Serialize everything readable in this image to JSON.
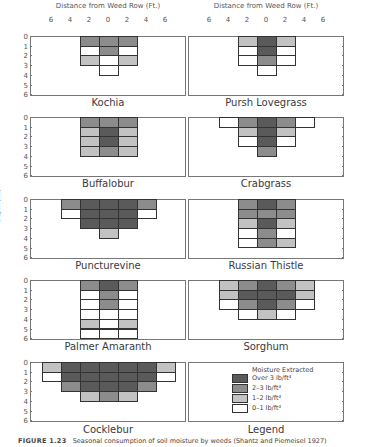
{
  "figure": {
    "x_axis_title": "Distance from Weed Row (Ft.)",
    "x_ticks": [
      "6",
      "4",
      "2",
      "0",
      "2",
      "4",
      "6"
    ],
    "y_axis_title": "Depth (Ft.)",
    "y_ticks": [
      "0",
      "1",
      "2",
      "3",
      "4",
      "5",
      "6"
    ],
    "caption_label": "FIGURE 1.23",
    "caption_text": "Seasonal consumption of soil moisture by weeds (Shantz and Piemeisel 1927)"
  },
  "legend": {
    "title": "Moisture Extracted",
    "label": "Legend",
    "items": [
      {
        "label": "Over 3 lb/ft³",
        "level": 3,
        "color": "#5a5a5a"
      },
      {
        "label": "2–3 lb/ft³",
        "level": 2,
        "color": "#8c8c8c"
      },
      {
        "label": "1–2 lb/ft³",
        "level": 1,
        "color": "#c2c2c2"
      },
      {
        "label": "0–1 lb/ft³",
        "level": 0,
        "color": "#ffffff"
      }
    ]
  },
  "chart_data": {
    "type": "heatmap",
    "title": "Seasonal consumption of soil moisture by weeds",
    "xlabel": "Distance from Weed Row (Ft.)",
    "ylabel": "Depth (Ft.)",
    "x_columns_ft": [
      -6,
      -4,
      -2,
      0,
      2,
      4,
      6
    ],
    "y_rows_ft": [
      0,
      1,
      2,
      3,
      4,
      5
    ],
    "level_scale": {
      "3": "Over 3 lb/ft³",
      "2": "2–3 lb/ft³",
      "1": "1–2 lb/ft³",
      "0": "0–1 lb/ft³",
      "null": "no data"
    },
    "grid": false,
    "legend_position": "bottom-right panel",
    "panels": [
      {
        "name": "Kochia",
        "grid": [
          [
            null,
            null,
            2,
            2,
            2,
            null,
            null
          ],
          [
            null,
            null,
            0,
            2,
            0,
            null,
            null
          ],
          [
            null,
            null,
            1,
            0,
            1,
            null,
            null
          ],
          [
            null,
            null,
            null,
            0,
            null,
            null,
            null
          ]
        ]
      },
      {
        "name": "Pursh Lovegrass",
        "grid": [
          [
            null,
            null,
            1,
            3,
            1,
            null,
            null
          ],
          [
            null,
            null,
            0,
            3,
            0,
            null,
            null
          ],
          [
            null,
            null,
            0,
            2,
            0,
            null,
            null
          ],
          [
            null,
            null,
            null,
            0,
            null,
            null,
            null
          ]
        ]
      },
      {
        "name": "Buffalobur",
        "grid": [
          [
            null,
            null,
            2,
            2,
            2,
            null,
            null
          ],
          [
            null,
            null,
            1,
            3,
            1,
            null,
            null
          ],
          [
            null,
            null,
            1,
            3,
            1,
            null,
            null
          ],
          [
            null,
            null,
            1,
            2,
            1,
            null,
            null
          ]
        ]
      },
      {
        "name": "Crabgrass",
        "grid": [
          [
            null,
            0,
            2,
            3,
            2,
            0,
            null
          ],
          [
            null,
            null,
            1,
            3,
            1,
            null,
            null
          ],
          [
            null,
            null,
            0,
            3,
            0,
            null,
            null
          ],
          [
            null,
            null,
            null,
            2,
            null,
            null,
            null
          ]
        ]
      },
      {
        "name": "Puncturevine",
        "grid": [
          [
            null,
            2,
            3,
            3,
            3,
            2,
            null
          ],
          [
            null,
            0,
            3,
            3,
            3,
            0,
            null
          ],
          [
            null,
            null,
            3,
            3,
            3,
            null,
            null
          ],
          [
            null,
            null,
            null,
            1,
            null,
            null,
            null
          ]
        ]
      },
      {
        "name": "Russian Thistle",
        "grid": [
          [
            null,
            null,
            2,
            3,
            2,
            null,
            null
          ],
          [
            null,
            null,
            2,
            2,
            2,
            null,
            null
          ],
          [
            null,
            null,
            1,
            3,
            1,
            null,
            null
          ],
          [
            null,
            null,
            0,
            2,
            0,
            null,
            null
          ],
          [
            null,
            null,
            0,
            2,
            1,
            null,
            null
          ]
        ]
      },
      {
        "name": "Palmer Amaranth",
        "grid": [
          [
            null,
            null,
            2,
            3,
            2,
            null,
            null
          ],
          [
            null,
            null,
            0,
            2,
            0,
            null,
            null
          ],
          [
            null,
            null,
            0,
            2,
            0,
            null,
            null
          ],
          [
            null,
            null,
            0,
            0,
            0,
            null,
            null
          ],
          [
            null,
            null,
            1,
            0,
            1,
            null,
            null
          ],
          [
            null,
            null,
            0,
            0,
            0,
            null,
            null
          ]
        ]
      },
      {
        "name": "Sorghum",
        "grid": [
          [
            null,
            1,
            2,
            3,
            2,
            1,
            null
          ],
          [
            null,
            1,
            3,
            3,
            3,
            1,
            null
          ],
          [
            null,
            0,
            2,
            3,
            2,
            0,
            null
          ],
          [
            null,
            null,
            0,
            1,
            0,
            null,
            null
          ]
        ]
      },
      {
        "name": "Cocklebur",
        "grid": [
          [
            1,
            3,
            3,
            3,
            3,
            3,
            1
          ],
          [
            0,
            3,
            3,
            3,
            3,
            3,
            0
          ],
          [
            null,
            2,
            3,
            3,
            3,
            2,
            null
          ],
          [
            null,
            null,
            1,
            2,
            1,
            null,
            null
          ]
        ]
      }
    ]
  }
}
